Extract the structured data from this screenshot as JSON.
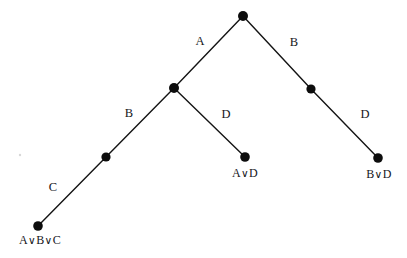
{
  "diagram": {
    "kind": "resolution-refutation-tree",
    "background_color": "#ffffff",
    "ink_color": "#0d0d0d",
    "edge_labels": {
      "root_left": "A",
      "root_right": "B",
      "mid_left": "B",
      "mid_right": "D",
      "lower_left": "C",
      "right_lower": "D"
    },
    "leaf_labels": {
      "left": "A∨B∨C",
      "center": "A∨D",
      "right": "B∨D"
    },
    "nodes": [
      {
        "id": "root",
        "name": "root-node",
        "x": 243,
        "y": 16,
        "r": 5.0
      },
      {
        "id": "mid-left",
        "name": "mid-left-node",
        "x": 174,
        "y": 88,
        "r": 5.0
      },
      {
        "id": "mid-right",
        "name": "mid-right-node",
        "x": 311,
        "y": 89,
        "r": 4.6
      },
      {
        "id": "lower-left",
        "name": "lower-left-node",
        "x": 106,
        "y": 157,
        "r": 4.6
      },
      {
        "id": "leaf-left",
        "name": "leaf-node-a-b-c",
        "x": 38,
        "y": 226,
        "r": 4.8
      },
      {
        "id": "leaf-center",
        "name": "leaf-node-a-d",
        "x": 245,
        "y": 157,
        "r": 4.8
      },
      {
        "id": "leaf-right",
        "name": "leaf-node-b-d",
        "x": 378,
        "y": 158,
        "r": 4.8
      }
    ],
    "edges": [
      {
        "name": "edge-root-to-mid-left",
        "x1": 243,
        "y1": 16,
        "x2": 174,
        "y2": 88
      },
      {
        "name": "edge-root-to-mid-right",
        "x1": 243,
        "y1": 16,
        "x2": 311,
        "y2": 89
      },
      {
        "name": "edge-mid-left-to-lower-left",
        "x1": 174,
        "y1": 88,
        "x2": 106,
        "y2": 157
      },
      {
        "name": "edge-mid-left-to-leaf-center",
        "x1": 174,
        "y1": 88,
        "x2": 245,
        "y2": 157
      },
      {
        "name": "edge-lower-left-to-leaf-left",
        "x1": 106,
        "y1": 157,
        "x2": 38,
        "y2": 226
      },
      {
        "name": "edge-mid-right-to-leaf-right",
        "x1": 311,
        "y1": 89,
        "x2": 378,
        "y2": 158
      }
    ],
    "label_positions": {
      "root_left": {
        "x": 200,
        "y": 41
      },
      "root_right": {
        "x": 294,
        "y": 42
      },
      "mid_left": {
        "x": 129,
        "y": 113
      },
      "mid_right": {
        "x": 226,
        "y": 114
      },
      "lower_left": {
        "x": 53,
        "y": 187
      },
      "right_lower": {
        "x": 365,
        "y": 114
      },
      "leaf_left": {
        "x": 40,
        "y": 234
      },
      "leaf_center": {
        "x": 245,
        "y": 167
      },
      "leaf_right": {
        "x": 379,
        "y": 168
      }
    }
  }
}
